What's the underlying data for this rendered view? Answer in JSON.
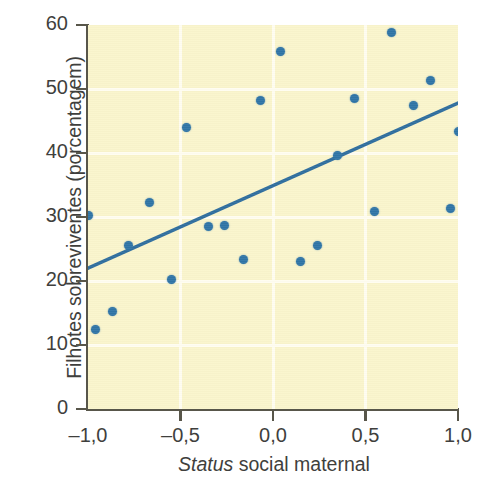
{
  "chart_data": {
    "type": "scatter",
    "title": "",
    "xlabel_parts": {
      "italic": "Status",
      "plain": " social maternal"
    },
    "xlabel": "Status social maternal",
    "ylabel": "Filhotes sobreviventes (porcentagem)",
    "xlim": [
      -1.0,
      1.0
    ],
    "ylim": [
      0,
      60
    ],
    "xticks": [
      -1.0,
      -0.5,
      0.0,
      0.5,
      1.0
    ],
    "xtick_labels": [
      "–1,0",
      "–0,5",
      "0,0",
      "0,5",
      "1,0"
    ],
    "yticks": [
      0,
      10,
      20,
      30,
      40,
      50,
      60
    ],
    "ytick_labels": [
      "0",
      "10",
      "20",
      "30",
      "40",
      "50",
      "60"
    ],
    "grid": true,
    "grid_color": "#fffdf0",
    "legend": null,
    "plot_background": "#faf5cc",
    "point_color": "#2f74a6",
    "line_color": "#2f6e9e",
    "axis_color": "#58564a",
    "points": [
      {
        "x": -1.0,
        "y": 30.3
      },
      {
        "x": -0.96,
        "y": 12.4
      },
      {
        "x": -0.87,
        "y": 15.2
      },
      {
        "x": -0.78,
        "y": 25.5
      },
      {
        "x": -0.67,
        "y": 32.3
      },
      {
        "x": -0.55,
        "y": 20.2
      },
      {
        "x": -0.47,
        "y": 44.0
      },
      {
        "x": -0.35,
        "y": 28.5
      },
      {
        "x": -0.26,
        "y": 28.7
      },
      {
        "x": -0.16,
        "y": 23.4
      },
      {
        "x": -0.07,
        "y": 48.2
      },
      {
        "x": 0.04,
        "y": 55.9
      },
      {
        "x": 0.15,
        "y": 23.1
      },
      {
        "x": 0.24,
        "y": 25.5
      },
      {
        "x": 0.35,
        "y": 39.6
      },
      {
        "x": 0.44,
        "y": 48.5
      },
      {
        "x": 0.55,
        "y": 30.8
      },
      {
        "x": 0.64,
        "y": 58.8
      },
      {
        "x": 0.76,
        "y": 47.5
      },
      {
        "x": 0.85,
        "y": 51.4
      },
      {
        "x": 0.96,
        "y": 31.4
      },
      {
        "x": 1.0,
        "y": 43.4
      }
    ],
    "trendline": {
      "x0": -1.0,
      "y0": 22.0,
      "x1": 1.0,
      "y1": 47.8
    }
  }
}
